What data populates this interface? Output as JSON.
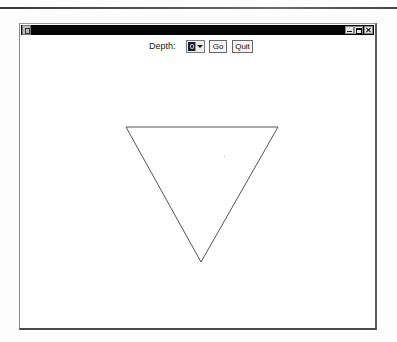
{
  "window": {
    "title": "",
    "controls": {
      "minimize": "minimize",
      "maximize": "maximize",
      "close": "close"
    }
  },
  "toolbar": {
    "depth_label": "Depth:",
    "depth_value": "0",
    "go_label": "Go",
    "quit_label": "Quit"
  },
  "drawing": {
    "shape": "triangle",
    "stroke_color": "#555555",
    "vertices": [
      {
        "x": 106,
        "y": 70
      },
      {
        "x": 258,
        "y": 70
      },
      {
        "x": 181,
        "y": 205
      }
    ]
  },
  "colors": {
    "titlebar": "#050505",
    "background": "#ffffff",
    "selected_value_bg": "#1a1a2a"
  }
}
